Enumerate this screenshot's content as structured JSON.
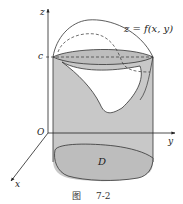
{
  "figure": {
    "caption_prefix": "图",
    "caption_number": "7-2",
    "labels": {
      "z_axis": "z",
      "y_axis": "y",
      "x_axis": "x",
      "origin": "O",
      "c_level": "c",
      "surface": "z = f(x, y)",
      "region": "D"
    },
    "colors": {
      "fill": "#c8c8c8",
      "stroke": "#333333",
      "background": "#ffffff"
    }
  }
}
